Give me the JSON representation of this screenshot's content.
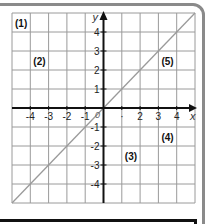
{
  "figure": {
    "grid": {
      "x_min": -5,
      "x_max": 5,
      "y_min": -5,
      "y_max": 5,
      "grid_color": "#9a9a9a",
      "axis_color": "#111111",
      "line_color": "#9a9a9a"
    },
    "axis_labels": {
      "x": "x",
      "y": "y"
    },
    "x_ticks": [
      {
        "value": -4,
        "label": "-4"
      },
      {
        "value": -3,
        "label": "-3"
      },
      {
        "value": -2,
        "label": "-2"
      },
      {
        "value": -1,
        "label": "-1"
      },
      {
        "value": 1,
        "label": "·"
      },
      {
        "value": 2,
        "label": "2"
      },
      {
        "value": 3,
        "label": "3"
      },
      {
        "value": 4,
        "label": "4"
      }
    ],
    "y_ticks": [
      {
        "value": 4,
        "label": "4"
      },
      {
        "value": 3,
        "label": "3"
      },
      {
        "value": 2,
        "label": "2"
      },
      {
        "value": 1,
        "label": "1"
      },
      {
        "value": -1,
        "label": "-1"
      },
      {
        "value": -2,
        "label": "-2"
      },
      {
        "value": -3,
        "label": "-3"
      },
      {
        "value": -4,
        "label": "-4"
      }
    ],
    "origin_label": "0",
    "region_labels": [
      {
        "id": "1",
        "text": "(1)",
        "x": -4.5,
        "y": 4.5
      },
      {
        "id": "2",
        "text": "(2)",
        "x": -3.5,
        "y": 2.5
      },
      {
        "id": "3",
        "text": "(3)",
        "x": 1.5,
        "y": -2.5
      },
      {
        "id": "4",
        "text": "(4)",
        "x": 3.5,
        "y": -1.5
      },
      {
        "id": "5",
        "text": "(5)",
        "x": 3.5,
        "y": 2.5
      }
    ]
  },
  "chart_data": {
    "type": "line",
    "title": "",
    "xlabel": "x",
    "ylabel": "y",
    "xlim": [
      -5,
      5
    ],
    "ylim": [
      -5,
      5
    ],
    "grid": true,
    "x_tick_labels": [
      "-4",
      "-3",
      "-2",
      "-1",
      "0",
      "1",
      "2",
      "3",
      "4"
    ],
    "y_tick_labels": [
      "4",
      "3",
      "2",
      "1",
      "-1",
      "-2",
      "-3",
      "-4"
    ],
    "series": [
      {
        "name": "y = x",
        "x": [
          -5,
          5
        ],
        "y": [
          -5,
          5
        ]
      }
    ],
    "annotations": [
      {
        "text": "(1)",
        "x": -4.5,
        "y": 4.5
      },
      {
        "text": "(2)",
        "x": -3.5,
        "y": 2.5
      },
      {
        "text": "(3)",
        "x": 1.5,
        "y": -2.5
      },
      {
        "text": "(4)",
        "x": 3.5,
        "y": -1.5
      },
      {
        "text": "(5)",
        "x": 3.5,
        "y": 2.5
      }
    ]
  }
}
